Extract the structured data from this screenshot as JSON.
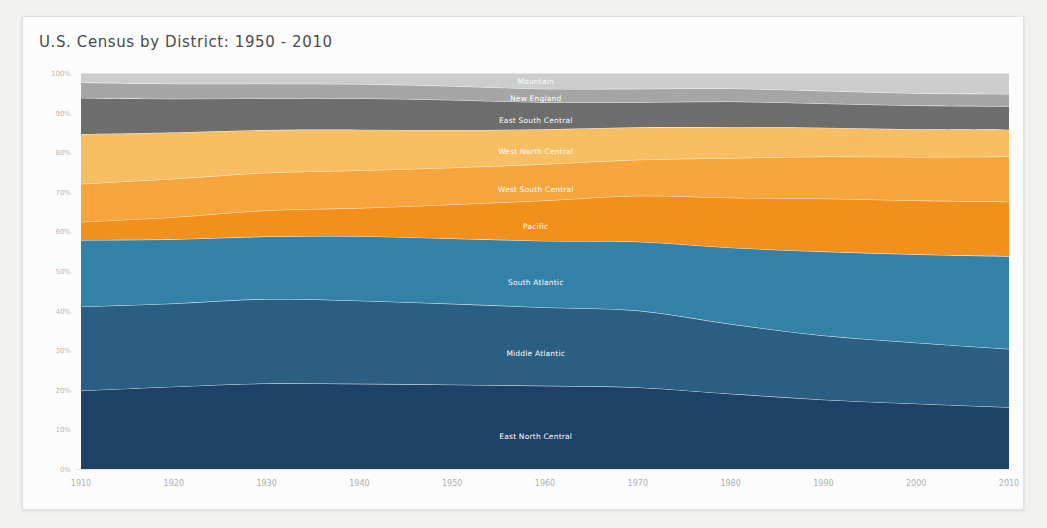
{
  "card": {
    "title": "U.S. Census by District: 1950 - 2010"
  },
  "chart_data": {
    "type": "area",
    "title": "U.S. Census by District: 1950 - 2010",
    "xlabel": "",
    "ylabel": "",
    "stacked": true,
    "normalized": true,
    "grid": false,
    "legend": "inline-labels",
    "ylim": [
      0,
      100
    ],
    "yticks": [
      0,
      10,
      20,
      30,
      40,
      50,
      60,
      70,
      80,
      90,
      100
    ],
    "ytick_labels": [
      "0%",
      "10%",
      "20%",
      "30%",
      "40%",
      "50%",
      "60%",
      "70%",
      "80%",
      "90%",
      "100%"
    ],
    "x": [
      1910,
      1920,
      1930,
      1940,
      1950,
      1960,
      1970,
      1980,
      1990,
      2000,
      2010
    ],
    "xtick_labels": [
      "1910",
      "1920",
      "1930",
      "1940",
      "1950",
      "1960",
      "1970",
      "1980",
      "1990",
      "2000",
      "2010"
    ],
    "series": [
      {
        "name": "East North Central",
        "color": "#1f4268",
        "values": [
          19.8,
          20.8,
          21.6,
          21.5,
          21.3,
          21.0,
          20.6,
          19.0,
          17.5,
          16.5,
          15.6
        ]
      },
      {
        "name": "Middle Atlantic",
        "color": "#2b5f84",
        "values": [
          21.2,
          21.0,
          21.3,
          21.0,
          20.4,
          19.8,
          19.4,
          17.6,
          16.2,
          15.4,
          14.7
        ]
      },
      {
        "name": "South Atlantic",
        "color": "#3583a9",
        "values": [
          16.8,
          16.2,
          15.8,
          16.3,
          16.5,
          16.8,
          17.4,
          19.3,
          21.2,
          22.3,
          23.4
        ]
      },
      {
        "name": "Pacific",
        "color": "#f5921d",
        "values": [
          4.6,
          5.6,
          6.6,
          7.1,
          8.6,
          10.2,
          11.6,
          12.6,
          13.4,
          13.6,
          13.8
        ]
      },
      {
        "name": "West South Central",
        "color": "#f9a73e",
        "values": [
          9.6,
          9.7,
          9.5,
          9.5,
          9.3,
          9.2,
          9.1,
          10.0,
          10.6,
          11.0,
          11.4
        ]
      },
      {
        "name": "West North Central",
        "color": "#fbc063",
        "values": [
          12.6,
          11.7,
          10.8,
          10.3,
          9.5,
          8.8,
          8.2,
          7.8,
          7.3,
          7.0,
          6.8
        ]
      },
      {
        "name": "East South Central",
        "color": "#6f6f6f",
        "values": [
          9.1,
          8.5,
          8.0,
          7.9,
          7.6,
          6.8,
          6.3,
          6.5,
          6.1,
          6.0,
          5.9
        ]
      },
      {
        "name": "New England",
        "color": "#a7a7a7",
        "values": [
          3.9,
          3.8,
          3.7,
          3.6,
          3.5,
          3.4,
          3.4,
          3.3,
          3.2,
          3.1,
          3.1
        ]
      },
      {
        "name": "Mountain",
        "color": "#cfcfcf",
        "values": [
          2.4,
          2.7,
          2.7,
          2.8,
          3.3,
          4.0,
          4.0,
          3.9,
          4.5,
          5.1,
          5.3
        ]
      }
    ],
    "series_label_positions": [
      {
        "name": "East North Central",
        "x_frac": 0.49,
        "y_pct": 7.5
      },
      {
        "name": "Middle Atlantic",
        "x_frac": 0.49,
        "y_pct": 28.5
      },
      {
        "name": "South Atlantic",
        "x_frac": 0.49,
        "y_pct": 46.5
      },
      {
        "name": "Pacific",
        "x_frac": 0.49,
        "y_pct": 60.5
      },
      {
        "name": "West South Central",
        "x_frac": 0.49,
        "y_pct": 70.0
      },
      {
        "name": "West North Central",
        "x_frac": 0.49,
        "y_pct": 79.5
      },
      {
        "name": "East South Central",
        "x_frac": 0.49,
        "y_pct": 87.5
      },
      {
        "name": "New England",
        "x_frac": 0.49,
        "y_pct": 93.0
      },
      {
        "name": "Mountain",
        "x_frac": 0.49,
        "y_pct": 97.2
      }
    ]
  }
}
